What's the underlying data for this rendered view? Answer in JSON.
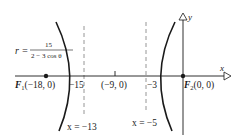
{
  "diagram": {
    "type": "hyperbola-polar-graph",
    "equation": {
      "lhs": "r =",
      "numerator": "15",
      "denominator": "2 − 3 cos θ"
    },
    "axes": {
      "x_label": "x",
      "y_label": "y"
    },
    "points": [
      {
        "name": "F1",
        "label_main": "F",
        "label_sub": "1",
        "label_coords": "(−18, 0)"
      },
      {
        "name": "F2",
        "label_main": "F",
        "label_sub": "2",
        "label_coords": "(0, 0)"
      }
    ],
    "ticks": {
      "left_vertex": "−15",
      "center": "(−9, 0)",
      "right_vertex": "−3"
    },
    "directrices": [
      {
        "label": "x = −13"
      },
      {
        "label": "x = −5"
      }
    ],
    "colors": {
      "stroke": "#1a1a1a",
      "dashed": "#8a8a8a",
      "background": "#ffffff"
    }
  }
}
